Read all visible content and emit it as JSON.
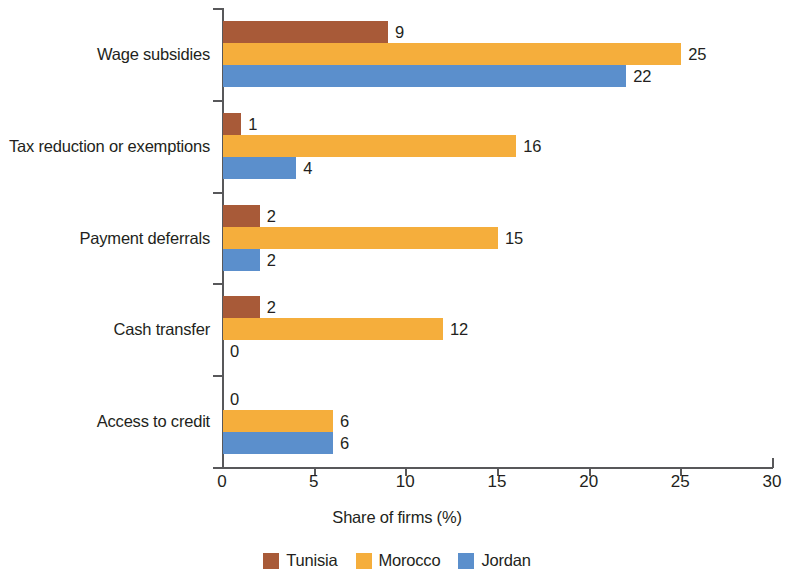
{
  "chart_data": {
    "type": "bar",
    "orientation": "horizontal",
    "title": "",
    "xlabel": "Share of firms (%)",
    "ylabel": "",
    "xlim": [
      0,
      30
    ],
    "xticks": [
      0,
      5,
      10,
      15,
      20,
      25,
      30
    ],
    "grid": false,
    "legend_position": "bottom",
    "categories": [
      "Wage subsidies",
      "Tax reduction or exemptions",
      "Payment deferrals",
      "Cash transfer",
      "Access to credit"
    ],
    "series": [
      {
        "name": "Tunisia",
        "color": "#A85A38",
        "values": [
          9,
          1,
          2,
          2,
          0
        ]
      },
      {
        "name": "Morocco",
        "color": "#F5AE3C",
        "values": [
          25,
          16,
          15,
          12,
          6
        ]
      },
      {
        "name": "Jordan",
        "color": "#5B8FCC",
        "values": [
          22,
          4,
          2,
          0,
          6
        ]
      }
    ]
  },
  "axis": {
    "x_title": "Share of firms (%)",
    "x_tick_labels": [
      "0",
      "5",
      "10",
      "15",
      "20",
      "25",
      "30"
    ]
  },
  "legend": {
    "items": [
      {
        "label": "Tunisia",
        "color": "#A85A38"
      },
      {
        "label": "Morocco",
        "color": "#F5AE3C"
      },
      {
        "label": "Jordan",
        "color": "#5B8FCC"
      }
    ]
  }
}
